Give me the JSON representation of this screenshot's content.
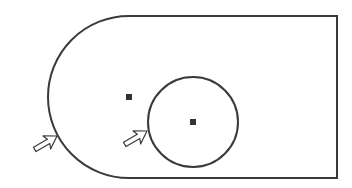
{
  "diagram": {
    "colors": {
      "stroke": "#3a3a3a",
      "background": "#ffffff",
      "marker": "#333333"
    },
    "outer_shape": {
      "type": "slot-rectangle-with-semicircular-left-end",
      "top_y": 16,
      "bottom_y": 178,
      "right_x": 337,
      "arc_center": [
        129,
        97
      ],
      "arc_radius": 81
    },
    "inner_circle": {
      "center": [
        193,
        122
      ],
      "radius": 45
    },
    "center_markers": [
      {
        "name": "arc-center-point",
        "x": 129,
        "y": 97
      },
      {
        "name": "circle-center-point",
        "x": 193,
        "y": 122
      }
    ],
    "pointer_arrows": [
      {
        "name": "arrow-outer-edge",
        "tip": [
          57,
          136
        ],
        "target": "outer arc edge"
      },
      {
        "name": "arrow-inner-circle",
        "tip": [
          147,
          131
        ],
        "target": "inner circle edge"
      }
    ]
  }
}
